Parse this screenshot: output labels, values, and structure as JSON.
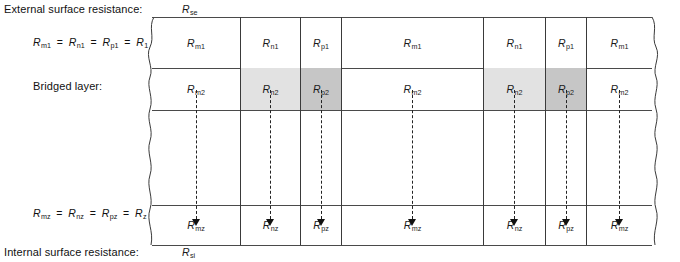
{
  "diagram": {
    "title_left_top": "External surface resistance:",
    "title_left_bottom": "Internal surface resistance:",
    "label_bridged_layer": "Bridged layer:",
    "symbol_external": {
      "base": "R",
      "sub": "se"
    },
    "symbol_internal": {
      "base": "R",
      "sub": "si"
    },
    "equation_layer1": {
      "terms": [
        {
          "base": "R",
          "sub": "m1"
        },
        {
          "base": "R",
          "sub": "n1"
        },
        {
          "base": "R",
          "sub": "p1"
        },
        {
          "base": "R",
          "sub": "1"
        }
      ],
      "operator": "="
    },
    "equation_layerz": {
      "terms": [
        {
          "base": "R",
          "sub": "mz"
        },
        {
          "base": "R",
          "sub": "nz"
        },
        {
          "base": "R",
          "sub": "pz"
        },
        {
          "base": "R",
          "sub": "z"
        }
      ],
      "operator": "="
    },
    "columns": [
      {
        "name": "m",
        "x": 0,
        "width": 88
      },
      {
        "name": "n",
        "x": 88,
        "width": 60
      },
      {
        "name": "p",
        "x": 148,
        "width": 41
      },
      {
        "name": "m",
        "x": 189,
        "width": 142
      },
      {
        "name": "n",
        "x": 331,
        "width": 62
      },
      {
        "name": "p",
        "x": 393,
        "width": 41
      },
      {
        "name": "m",
        "x": 434,
        "width": 66
      }
    ],
    "rows": [
      {
        "id": "layer1",
        "y": 0,
        "height": 51,
        "shaded": false,
        "cells": [
          {
            "base": "R",
            "sub": "m1"
          },
          {
            "base": "R",
            "sub": "n1"
          },
          {
            "base": "R",
            "sub": "p1"
          },
          {
            "base": "R",
            "sub": "m1"
          },
          {
            "base": "R",
            "sub": "n1"
          },
          {
            "base": "R",
            "sub": "p1"
          },
          {
            "base": "R",
            "sub": "m1"
          }
        ]
      },
      {
        "id": "bridged",
        "y": 51,
        "height": 42,
        "shaded": true,
        "cells": [
          {
            "base": "R",
            "sub": "m2"
          },
          {
            "base": "R",
            "sub": "n2"
          },
          {
            "base": "R",
            "sub": "p2"
          },
          {
            "base": "R",
            "sub": "m2"
          },
          {
            "base": "R",
            "sub": "n2"
          },
          {
            "base": "R",
            "sub": "p2"
          },
          {
            "base": "R",
            "sub": "m2"
          }
        ]
      },
      {
        "id": "middle",
        "y": 93,
        "height": 95,
        "shaded": false,
        "cells": [
          {
            "base": "",
            "sub": ""
          },
          {
            "base": "",
            "sub": ""
          },
          {
            "base": "",
            "sub": ""
          },
          {
            "base": "",
            "sub": ""
          },
          {
            "base": "",
            "sub": ""
          },
          {
            "base": "",
            "sub": ""
          },
          {
            "base": "",
            "sub": ""
          }
        ]
      },
      {
        "id": "layerz",
        "y": 188,
        "height": 40,
        "shaded": false,
        "cells": [
          {
            "base": "R",
            "sub": "mz"
          },
          {
            "base": "R",
            "sub": "nz"
          },
          {
            "base": "R",
            "sub": "pz"
          },
          {
            "base": "R",
            "sub": "mz"
          },
          {
            "base": "R",
            "sub": "nz"
          },
          {
            "base": "R",
            "sub": "pz"
          },
          {
            "base": "R",
            "sub": "mz"
          }
        ]
      }
    ],
    "shading": {
      "light": "#e2e2e2",
      "dark": "#c6c6c6",
      "none": "#ffffff"
    },
    "arrow_count": 7,
    "line_color": "#3a3a3a"
  }
}
